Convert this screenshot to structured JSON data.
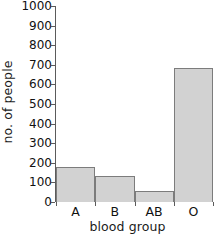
{
  "chart_data": {
    "type": "bar",
    "title": "",
    "xlabel": "blood group",
    "ylabel": "no. of people",
    "categories": [
      "A",
      "B",
      "AB",
      "O"
    ],
    "values": [
      180,
      132,
      58,
      683
    ],
    "ylim": [
      0,
      1000
    ],
    "ytick_labels": [
      "0",
      "100",
      "200",
      "300",
      "400",
      "500",
      "600",
      "700",
      "800",
      "900",
      "1000"
    ],
    "ytick_values": [
      0,
      100,
      200,
      300,
      400,
      500,
      600,
      700,
      800,
      900,
      1000
    ],
    "grid": false,
    "legend": false,
    "bar_fill_color": "#d2d2d2",
    "bar_edge_color": "#7c7c7c",
    "axis_color": "#5b5b5b",
    "text_color": "#111111"
  }
}
